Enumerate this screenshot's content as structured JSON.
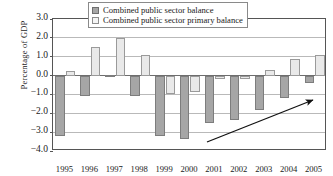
{
  "chart_data": {
    "type": "bar",
    "title": "",
    "xlabel": "",
    "ylabel": "Percentage of GDP",
    "ylim": [
      -4.0,
      3.0
    ],
    "yticks": [
      "3.0",
      "2.0",
      "1.0",
      "0.0",
      "−1.0",
      "−2.0",
      "−3.0",
      "−4.0"
    ],
    "ytick_values": [
      3.0,
      2.0,
      1.0,
      0.0,
      -1.0,
      -2.0,
      -3.0,
      -4.0
    ],
    "grid": true,
    "legend_position": "top-center",
    "categories": [
      "1995",
      "1996",
      "1997",
      "1998",
      "1999",
      "2000",
      "2001",
      "2002",
      "2003",
      "2004",
      "2005"
    ],
    "series": [
      {
        "name": "Combined public sector balance",
        "color": "#a6a6a6",
        "values": [
          -3.2,
          -1.1,
          0.05,
          -1.1,
          -3.2,
          -3.35,
          -2.5,
          -2.35,
          -1.8,
          -1.2,
          -0.4
        ]
      },
      {
        "name": "Combined public sector primary balance",
        "color": "#e9e9e9",
        "values": [
          0.25,
          1.5,
          2.0,
          1.1,
          -1.0,
          -0.85,
          -0.2,
          -0.2,
          0.3,
          0.9,
          1.1
        ]
      }
    ],
    "annotations": [
      {
        "kind": "arrow",
        "label": "upward-trend-arrow",
        "from": [
          207,
          142
        ],
        "to": [
          313,
          100
        ]
      }
    ]
  },
  "legend": {
    "items": [
      {
        "label": "Combined public sector balance",
        "swatch": "dark-swatch"
      },
      {
        "label": "Combined public sector primary balance",
        "swatch": "light-swatch"
      }
    ]
  }
}
